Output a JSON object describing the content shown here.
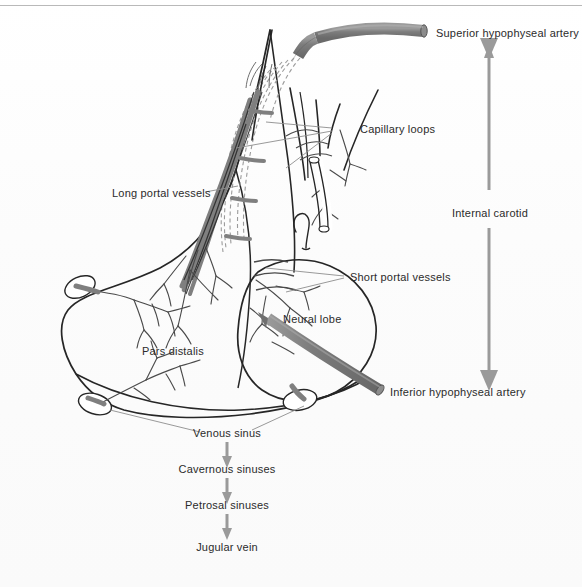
{
  "figure": {
    "labels": {
      "superior_hypophyseal_artery": "Superior hypophyseal artery",
      "capillary_loops": "Capillary loops",
      "long_portal_vessels": "Long portal vessels",
      "short_portal_vessels": "Short portal vessels",
      "neural_lobe": "Neural lobe",
      "pars_distalis": "Pars distalis",
      "inferior_hypophyseal_artery": "Inferior hypophyseal artery",
      "internal_carotid": "Internal carotid",
      "venous_sinus": "Venous sinus"
    },
    "flow_chart": {
      "steps": [
        "Venous sinus",
        "Cavernous sinuses",
        "Petrosal sinuses",
        "Jugular vein"
      ]
    },
    "colors": {
      "artery": "#808080",
      "artery_dark": "#5f5f5f",
      "outline": "#262626",
      "vessel": "#4a4a4a",
      "capillary_dashed": "#9a9a9a",
      "leader": "#8d8d8d",
      "arrow": "#9a9a9a",
      "text": "#2b2b2b",
      "rule": "#b9b9b9",
      "background": "#fdfdfd"
    }
  }
}
